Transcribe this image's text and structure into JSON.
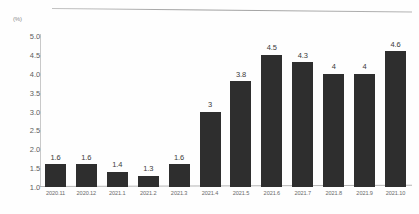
{
  "chart_data": {
    "type": "bar",
    "title": "",
    "subtitle": "",
    "xlabel": "",
    "ylabel": "",
    "unit_label": "(%)",
    "categories": [
      "2020.11",
      "2020.12",
      "2021.1",
      "2021.2",
      "2021.3",
      "2021.4",
      "2021.5",
      "2021.6",
      "2021.7",
      "2021.8",
      "2021.9",
      "2021.10"
    ],
    "values": [
      1.6,
      1.6,
      1.4,
      1.3,
      1.6,
      3,
      3.8,
      4.5,
      4.3,
      4,
      4,
      4.6
    ],
    "data_labels": [
      "1.6",
      "1.6",
      "1.4",
      "1.3",
      "1.6",
      "3",
      "3.8",
      "4.5",
      "4.3",
      "4",
      "4",
      "4.6"
    ],
    "ylim": [
      1.0,
      5.0
    ],
    "y_ticks": [
      1.0,
      1.5,
      2.0,
      2.5,
      3.0,
      3.5,
      4.0,
      4.5,
      5.0
    ],
    "y_tick_labels": [
      "1.0",
      "1.5",
      "2.0",
      "2.5",
      "3.0",
      "3.5",
      "4.0",
      "4.5",
      "5.0"
    ],
    "grid": false,
    "legend": null,
    "legend_position": "none",
    "bar_color": "#2e2e2e",
    "axis_color": "#c9c9c9",
    "background_color": "#fefefe",
    "text_color": "#5d5d5d"
  }
}
